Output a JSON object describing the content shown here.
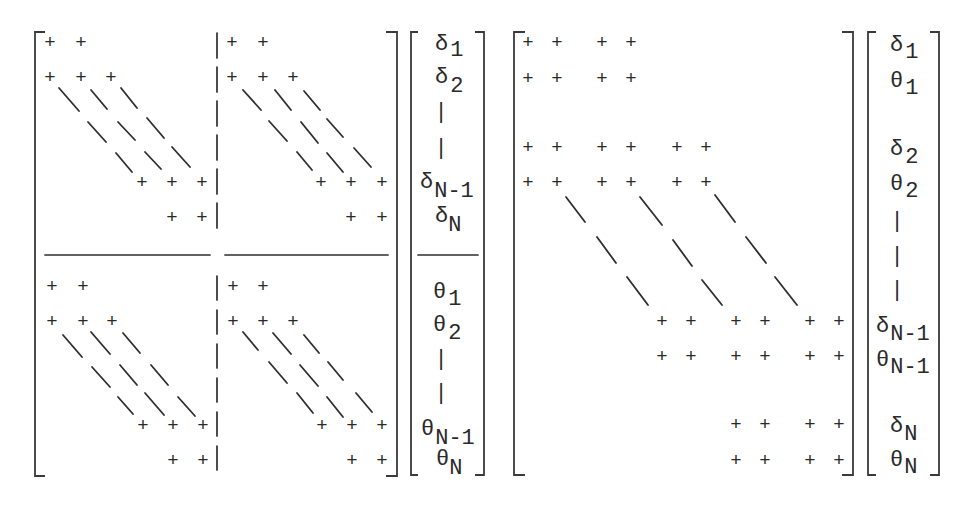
{
  "figure": {
    "symbols": {
      "nonzero": "+",
      "vertical_ellipsis": "|"
    },
    "left_system": {
      "matrix": {
        "blocks": [
          "top-left",
          "top-right",
          "bottom-left",
          "bottom-right"
        ]
      },
      "vector": {
        "entries": [
          {
            "base": "δ",
            "sub": "1"
          },
          {
            "base": "δ",
            "sub": "2"
          },
          {
            "base": "δ",
            "sub": "N-1"
          },
          {
            "base": "δ",
            "sub": "N"
          },
          {
            "base": "θ",
            "sub": "1"
          },
          {
            "base": "θ",
            "sub": "2"
          },
          {
            "base": "θ",
            "sub": "N-1"
          },
          {
            "base": "θ",
            "sub": "N"
          }
        ]
      }
    },
    "right_system": {
      "vector": {
        "entries": [
          {
            "base": "δ",
            "sub": "1"
          },
          {
            "base": "θ",
            "sub": "1"
          },
          {
            "base": "δ",
            "sub": "2"
          },
          {
            "base": "θ",
            "sub": "2"
          },
          {
            "base": "δ",
            "sub": "N-1"
          },
          {
            "base": "θ",
            "sub": "N-1"
          },
          {
            "base": "δ",
            "sub": "N"
          },
          {
            "base": "θ",
            "sub": "N"
          }
        ]
      }
    }
  }
}
